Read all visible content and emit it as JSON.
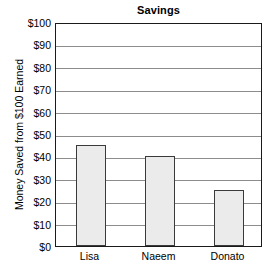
{
  "chart_data": {
    "type": "bar",
    "title": "Savings",
    "xlabel": "",
    "ylabel": "Money Saved from $100 Earned",
    "categories": [
      "Lisa",
      "Naeem",
      "Donato"
    ],
    "values": [
      45,
      40,
      25
    ],
    "ylim": [
      0,
      100
    ],
    "ytick_values": [
      0,
      10,
      20,
      30,
      40,
      50,
      60,
      70,
      80,
      90,
      100
    ],
    "ytick_labels": [
      "$0",
      "$10",
      "$20",
      "$30",
      "$40",
      "$50",
      "$60",
      "$70",
      "$80",
      "$90",
      "$100"
    ],
    "grid": "horizontal",
    "legend": "none",
    "bar_fill_color": "#ebebeb",
    "bar_border_color": "#3a3a3a",
    "gridline_color": "#8c8c8c",
    "axis_color": "#1a1a1a",
    "background_color": "#ffffff"
  }
}
